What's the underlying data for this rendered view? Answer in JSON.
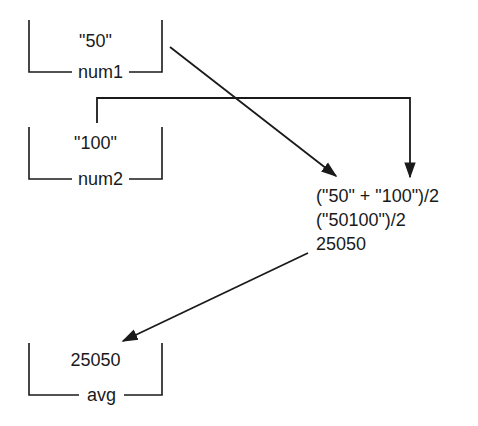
{
  "variables": [
    {
      "name": "num1",
      "value": "\"50\""
    },
    {
      "name": "num2",
      "value": "\"100\""
    },
    {
      "name": "avg",
      "value": "25050"
    }
  ],
  "expression": {
    "lines": [
      "(\"50\" + \"100\")/2",
      "(\"50100\")/2",
      "25050"
    ]
  },
  "colors": {
    "line": "#1a1a1a",
    "background": "#ffffff"
  }
}
